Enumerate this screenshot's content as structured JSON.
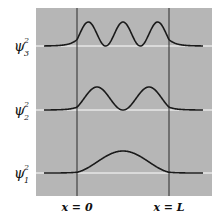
{
  "figure": {
    "background_color": "#b6b6b6",
    "baseline_color": "#ffffff",
    "curve_color": "#1a1a1a",
    "boundary_color": "#2a2a2a"
  },
  "levels": [
    {
      "name": "psi3",
      "symbol": "ψ",
      "subscript": "3",
      "superscript": "2",
      "n": 3
    },
    {
      "name": "psi2",
      "symbol": "ψ",
      "subscript": "2",
      "superscript": "2",
      "n": 2
    },
    {
      "name": "psi1",
      "symbol": "ψ",
      "subscript": "1",
      "superscript": "2",
      "n": 1
    }
  ],
  "axis_labels": {
    "left": "x = 0",
    "right": "x = L"
  }
}
